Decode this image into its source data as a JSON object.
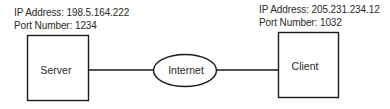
{
  "diagram": {
    "server": {
      "label": "Server",
      "ip_line": "IP Address: 198.5.164.222",
      "port_line": "Port Number: 1234"
    },
    "network": {
      "label": "Internet"
    },
    "client": {
      "label": "Client",
      "ip_line": "IP Address: 205.231.234.12",
      "port_line": "Port Number: 1032"
    },
    "colors": {
      "stroke": "#1a1a1a",
      "text": "#2a2a2a",
      "background": "#ffffff"
    }
  }
}
